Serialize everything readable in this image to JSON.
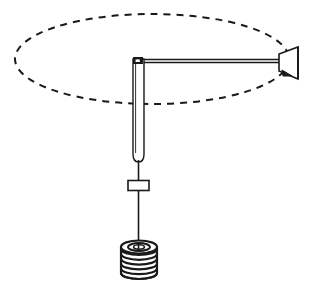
{
  "figure": {
    "background_color": "#ffffff",
    "stroke_color": "#1a1a1a",
    "canvas": {
      "width": 317,
      "height": 289
    },
    "parts": {
      "orbit_path": {
        "label": "dashed elliptical orbit path",
        "shape": "ellipse",
        "center_x": 152,
        "center_y": 59,
        "radius_x": 137,
        "radius_y": 45,
        "stroke_width": 2,
        "dash_pattern": "7 6",
        "color": "#1a1a1a"
      },
      "vertical_rod": {
        "label": "vertical rod / shaft",
        "x": 133,
        "y_top": 59,
        "y_bottom": 162,
        "width": 11,
        "stroke_width": 1.4,
        "fill": "#ffffff",
        "bottom_cap": "rounded"
      },
      "pivot_block": {
        "label": "pivot block at rod top",
        "x": 133,
        "y": 58,
        "width": 9,
        "height": 6,
        "fill": "#1a1a1a"
      },
      "horizontal_arm": {
        "label": "horizontal arm",
        "x_start": 138,
        "x_end": 281,
        "y": 61,
        "stroke_width": 1.6
      },
      "arm_top_edge": {
        "label": "arm upper edge line",
        "x_start": 138,
        "x_end": 281,
        "y": 59,
        "stroke_width": 1.4
      },
      "cone_nozzle": {
        "label": "cone nozzle at arm end",
        "x_narrow": 279,
        "x_wide": 298,
        "y_center": 65,
        "half_height_narrow": 6,
        "half_height_wide": 14,
        "stroke_width": 1.6,
        "fill": "#ffffff"
      },
      "string": {
        "label": "suspension string",
        "x": 138,
        "y_top": 160,
        "y_bottom": 252,
        "stroke_width": 1.6
      },
      "slider_block": {
        "label": "small rectangular slider block",
        "x": 128,
        "y": 180,
        "width": 21,
        "height": 10,
        "stroke_width": 1.6,
        "fill": "#ffffff"
      },
      "coil_weight": {
        "label": "coiled spring weight",
        "center_x": 139,
        "top_y": 247,
        "radius_x": 18,
        "radius_y": 6,
        "height": 32,
        "turns": 7,
        "stroke_width": 2.2
      }
    }
  }
}
